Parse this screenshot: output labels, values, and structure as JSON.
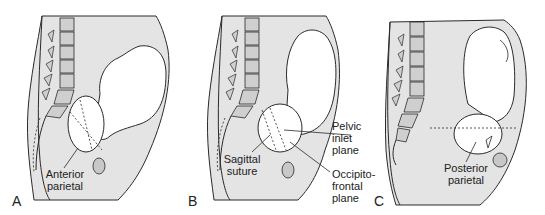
{
  "figure": {
    "colors": {
      "body_fill": "#e4e4e4",
      "vertebra_fill": "#cfcfcf",
      "fetus_fill": "#ffffff",
      "line": "#2a2a2a",
      "background": "#ffffff"
    },
    "panels": [
      {
        "letter": "A",
        "labels": {
          "anterior_parietal_1": "Anterior",
          "anterior_parietal_2": "parietal"
        }
      },
      {
        "letter": "B",
        "labels": {
          "sagittal_suture_1": "Sagittal",
          "sagittal_suture_2": "suture",
          "pelvic_inlet_1": "Pelvic",
          "pelvic_inlet_2": "inlet",
          "pelvic_inlet_3": "plane",
          "occipito_frontal_1": "Occipito-",
          "occipito_frontal_2": "frontal",
          "occipito_frontal_3": "plane"
        }
      },
      {
        "letter": "C",
        "labels": {
          "posterior_parietal_1": "Posterior",
          "posterior_parietal_2": "parietal"
        }
      }
    ]
  }
}
